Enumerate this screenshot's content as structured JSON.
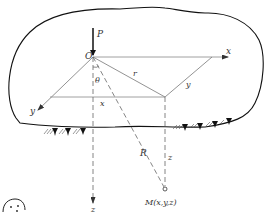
{
  "diagram": {
    "colors": {
      "outline": "#111111",
      "axis": "#777777",
      "dashed": "#666666",
      "text": "#333333",
      "background": "#ffffff"
    },
    "labels": {
      "force": "P",
      "origin": "O",
      "theta": "θ",
      "r": "r",
      "x_axis": "x",
      "y_axis": "y",
      "x_component": "x",
      "y_component": "y",
      "R": "R",
      "z_component": "z",
      "z_axis": "z",
      "point_M": "M(x,y,z)"
    },
    "elements": [
      {
        "id": "half-space-body",
        "type": "closed-outline"
      },
      {
        "id": "force-P",
        "type": "arrow",
        "direction": "down"
      },
      {
        "id": "x-axis",
        "type": "arrow",
        "direction": "right"
      },
      {
        "id": "y-axis",
        "type": "arrow",
        "direction": "down-left"
      },
      {
        "id": "z-axis",
        "type": "dashed-arrow",
        "direction": "down"
      },
      {
        "id": "r-line",
        "type": "line"
      },
      {
        "id": "R-line",
        "type": "dashed-line"
      },
      {
        "id": "z-line",
        "type": "dashed-line"
      },
      {
        "id": "support-hatching",
        "type": "hatch"
      },
      {
        "id": "point-M",
        "type": "small-circle"
      }
    ]
  }
}
